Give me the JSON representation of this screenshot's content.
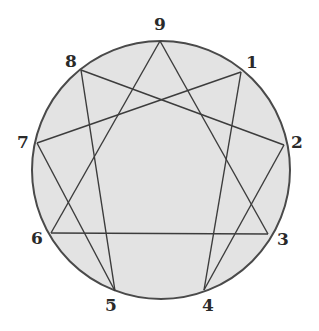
{
  "diagram": {
    "type": "enneagram",
    "circle": {
      "cx": 161,
      "cy": 170,
      "r": 129,
      "fill": "#e3e3e3",
      "stroke": "#4a4a4a"
    },
    "line_color": "#3c3c3c",
    "points": [
      {
        "id": "9",
        "label": "9",
        "x": 160,
        "y": 41,
        "lx": 160,
        "ly": 30
      },
      {
        "id": "1",
        "label": "1",
        "x": 241,
        "y": 72,
        "lx": 252,
        "ly": 68
      },
      {
        "id": "2",
        "label": "2",
        "x": 284,
        "y": 145,
        "lx": 297,
        "ly": 148
      },
      {
        "id": "3",
        "label": "3",
        "x": 268,
        "y": 234,
        "lx": 283,
        "ly": 245
      },
      {
        "id": "4",
        "label": "4",
        "x": 204,
        "y": 290,
        "lx": 208,
        "ly": 311
      },
      {
        "id": "5",
        "label": "5",
        "x": 115,
        "y": 291,
        "lx": 111,
        "ly": 311
      },
      {
        "id": "6",
        "label": "6",
        "x": 51,
        "y": 233,
        "lx": 37,
        "ly": 244
      },
      {
        "id": "7",
        "label": "7",
        "x": 37,
        "y": 143,
        "lx": 23,
        "ly": 148
      },
      {
        "id": "8",
        "label": "8",
        "x": 81,
        "y": 70,
        "lx": 71,
        "ly": 67
      }
    ],
    "triangle": [
      "9",
      "3",
      "6"
    ],
    "hexad": [
      "1",
      "4",
      "2",
      "8",
      "5",
      "7"
    ]
  }
}
